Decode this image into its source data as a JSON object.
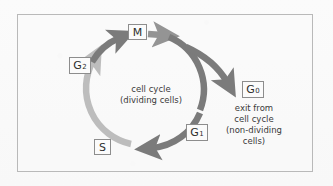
{
  "diagram": {
    "frame": {
      "border_color": "#b9b9b9",
      "background": "#fafafa"
    },
    "colors": {
      "arrow_dark": "#7b7b7b",
      "arrow_mid": "#9a9a9a",
      "arrow_light": "#bcbcbc",
      "box_border": "#8d8d8d",
      "box_fill": "#fbfbfb",
      "text": "#3a3a3a"
    },
    "nodes": [
      {
        "id": "m",
        "label": "M",
        "sub": "",
        "name": "label-m",
        "phase": "mitosis"
      },
      {
        "id": "g2",
        "label": "G",
        "sub": "2",
        "name": "label-g2",
        "phase": "gap 2"
      },
      {
        "id": "s",
        "label": "S",
        "sub": "",
        "name": "label-s",
        "phase": "synthesis"
      },
      {
        "id": "g1",
        "label": "G",
        "sub": "1",
        "name": "label-g1",
        "phase": "gap 1"
      },
      {
        "id": "g0",
        "label": "G",
        "sub": "0",
        "name": "label-g0",
        "phase": "quiescent"
      }
    ],
    "captions": {
      "cell_cycle_line1": "cell cycle",
      "cell_cycle_line2": "(dividing cells)",
      "exit_line1": "exit from",
      "exit_line2": "cell cycle",
      "exit_line3": "(non-dividing",
      "exit_line4": "cells)"
    }
  }
}
